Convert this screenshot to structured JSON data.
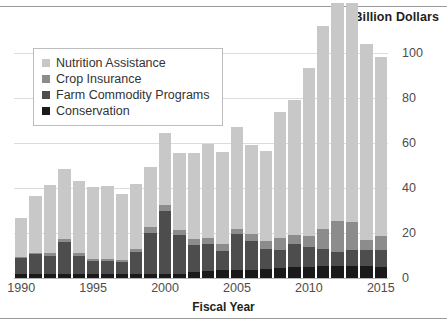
{
  "unit_title": "Billion Dollars",
  "x_axis_label": "Fiscal Year",
  "legend": {
    "items": [
      {
        "label": "Nutrition Assistance",
        "color": "#c8c8c8"
      },
      {
        "label": "Crop Insurance",
        "color": "#8c8c8c"
      },
      {
        "label": "Farm Commodity Programs",
        "color": "#4d4d4d"
      },
      {
        "label": "Conservation",
        "color": "#1a1a1a"
      }
    ]
  },
  "chart_data": {
    "type": "bar",
    "subtype": "stacked-bar",
    "title": "",
    "unit_title": "Billion Dollars",
    "xlabel": "Fiscal Year",
    "ylabel": "Billion Dollars",
    "ylim": [
      0,
      105
    ],
    "yticks": [
      0,
      20,
      40,
      60,
      80,
      100
    ],
    "ytick_labels": [
      "0",
      "20",
      "40",
      "60",
      "80",
      "100"
    ],
    "xticks": [
      1990,
      1995,
      2000,
      2005,
      2010,
      2015
    ],
    "xtick_labels": [
      "1990",
      "1995",
      "2000",
      "2005",
      "2010",
      "2015"
    ],
    "grid": "horizontal",
    "legend_position": "upper-left-inset",
    "categories": [
      1990,
      1991,
      1992,
      1993,
      1994,
      1995,
      1996,
      1997,
      1998,
      1999,
      2000,
      2001,
      2002,
      2003,
      2004,
      2005,
      2006,
      2007,
      2008,
      2009,
      2010,
      2011,
      2012,
      2013,
      2014,
      2015
    ],
    "series": [
      {
        "name": "Conservation",
        "color": "#1a1a1a",
        "values": [
          2.0,
          2.0,
          2.0,
          2.0,
          2.0,
          2.0,
          2.0,
          2.0,
          2.0,
          2.0,
          2.0,
          2.0,
          2.5,
          3.0,
          3.5,
          3.5,
          3.5,
          4.0,
          4.5,
          5.0,
          5.0,
          5.5,
          5.5,
          5.5,
          5.5,
          5.0
        ]
      },
      {
        "name": "Farm Commodity Programs",
        "color": "#4d4d4d",
        "values": [
          7.0,
          8.5,
          8.0,
          14.0,
          8.0,
          5.5,
          5.5,
          5.0,
          9.5,
          18.0,
          28.0,
          17.0,
          12.0,
          12.0,
          8.5,
          16.0,
          13.0,
          9.0,
          8.0,
          10.0,
          9.0,
          7.5,
          6.0,
          7.0,
          7.0,
          7.5
        ]
      },
      {
        "name": "Crop Insurance",
        "color": "#8c8c8c",
        "values": [
          0.5,
          0.5,
          1.0,
          1.5,
          1.0,
          1.0,
          1.0,
          1.0,
          1.5,
          2.5,
          2.5,
          2.5,
          3.0,
          3.0,
          3.0,
          2.5,
          3.0,
          3.5,
          5.5,
          4.0,
          4.5,
          9.0,
          14.0,
          12.5,
          4.5,
          6.0
        ]
      },
      {
        "name": "Nutrition Assistance",
        "color": "#c8c8c8",
        "values": [
          17.0,
          25.5,
          30.5,
          31.0,
          32.0,
          32.0,
          32.5,
          29.5,
          29.0,
          27.0,
          32.0,
          34.0,
          38.0,
          41.5,
          41.0,
          45.0,
          39.5,
          40.0,
          56.0,
          60.0,
          75.0,
          90.0,
          97.0,
          97.5,
          87.0,
          80.0
        ]
      }
    ],
    "totals": [
      26.5,
      36.5,
      41.5,
      48.5,
      43.0,
      40.5,
      41.0,
      37.5,
      42.0,
      49.5,
      64.5,
      55.5,
      55.5,
      59.5,
      56.0,
      67.0,
      59.0,
      56.5,
      74.0,
      79.0,
      93.5,
      112.0,
      122.5,
      122.5,
      104.0,
      98.5
    ]
  }
}
